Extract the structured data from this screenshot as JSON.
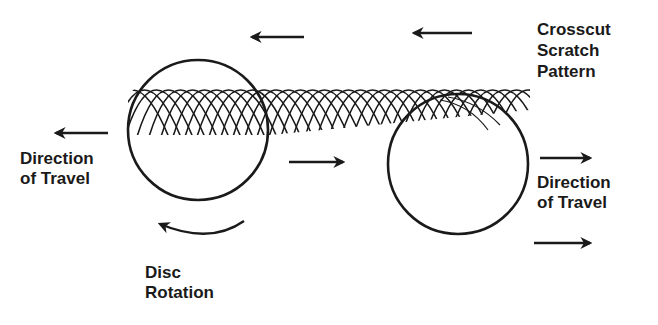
{
  "diagram": {
    "colors": {
      "ink": "#1a1a1a",
      "background": "#ffffff"
    },
    "labels": {
      "crosscut": {
        "line1": "Crosscut",
        "line2": "Scratch",
        "line3": "Pattern"
      },
      "direction_left": {
        "line1": "Direction",
        "line2": "of Travel"
      },
      "direction_right": {
        "line1": "Direction",
        "line2": "of Travel"
      },
      "disc_rotation": {
        "line1": "Disc",
        "line2": "Rotation"
      }
    },
    "arrows": [
      {
        "name": "pattern-arrow-1",
        "direction": "left"
      },
      {
        "name": "pattern-arrow-2",
        "direction": "left"
      },
      {
        "name": "travel-left-arrow",
        "direction": "left"
      },
      {
        "name": "middle-arrow",
        "direction": "right"
      },
      {
        "name": "travel-right-arrow-top",
        "direction": "right"
      },
      {
        "name": "travel-right-arrow-bottom",
        "direction": "right"
      },
      {
        "name": "rotation-arrow",
        "direction": "counterclockwise"
      }
    ],
    "discs": [
      {
        "name": "left-disc",
        "cx": 198,
        "cy": 130,
        "r": 70
      },
      {
        "name": "right-disc",
        "cx": 458,
        "cy": 164,
        "r": 70
      }
    ]
  }
}
